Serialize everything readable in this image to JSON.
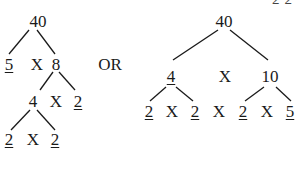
{
  "left_tree": {
    "root": "40",
    "level1": {
      "left": "5",
      "op": "X",
      "right": "8"
    },
    "level2": {
      "left": "4",
      "op": "X",
      "right": "2"
    },
    "level3": {
      "left": "2",
      "op": "X",
      "right": "2"
    }
  },
  "separator": "OR",
  "right_tree": {
    "root": "40",
    "level1": {
      "left": "4",
      "op": "X",
      "right": "10"
    },
    "level2": {
      "a": "2",
      "op1": "X",
      "b": "2",
      "op2": "X",
      "c": "2",
      "op3": "X",
      "d": "5"
    }
  },
  "top_right_cropped": "2·2"
}
